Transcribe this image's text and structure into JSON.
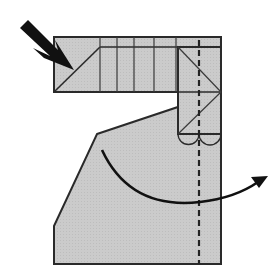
{
  "diagram": {
    "type": "folding-instruction",
    "colors": {
      "paper_fill": "#c9c9c9",
      "outline": "#2a2a2a",
      "crease": "#3a3a3a",
      "arrow": "#111111",
      "background": "#ffffff"
    },
    "elements": {
      "push_arrow": {
        "icon": "push-arrow-icon",
        "direction": "down-right"
      },
      "fold_arrow": {
        "icon": "curved-arrow-icon",
        "direction": "right"
      },
      "fold_line": {
        "style": "dashed",
        "type": "valley-fold"
      },
      "scallops": {
        "count": 2
      }
    }
  }
}
